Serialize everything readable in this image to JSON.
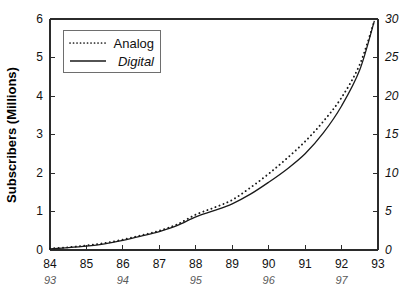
{
  "chart_data": {
    "type": "line",
    "title": "",
    "subtitle": "",
    "xlabel": "",
    "ylabel": "Subscribers (Millions)",
    "ylabel_right": "",
    "grid": false,
    "legend_position": "top-left",
    "xlim": [
      84,
      93
    ],
    "ylim": [
      0,
      6
    ],
    "ylim_right": [
      0,
      30
    ],
    "x_ticks": [
      84,
      85,
      86,
      87,
      88,
      89,
      90,
      91,
      92,
      93
    ],
    "x_tick_labels": [
      "84",
      "85",
      "86",
      "87",
      "88",
      "89",
      "90",
      "91",
      "92",
      "93"
    ],
    "x_ticks_secondary": [
      84,
      86,
      88,
      90,
      92
    ],
    "x_tick_labels_secondary": [
      "93",
      "94",
      "95",
      "96",
      "97"
    ],
    "y_ticks_left": [
      0,
      1,
      2,
      3,
      4,
      5,
      6
    ],
    "y_tick_labels_left": [
      "0",
      "1",
      "2",
      "3",
      "4",
      "5",
      "6"
    ],
    "y_ticks_right": [
      0,
      5,
      10,
      15,
      20,
      25,
      30
    ],
    "y_tick_labels_right": [
      "0",
      "5",
      "10",
      "15",
      "20",
      "25",
      "30"
    ],
    "series": [
      {
        "name": "Analog",
        "style": "dotted",
        "color": "#1a1a1a",
        "x": [
          84.0,
          84.5,
          85.0,
          85.5,
          86.0,
          86.5,
          87.0,
          87.5,
          88.0,
          88.5,
          89.0,
          89.5,
          90.0,
          90.5,
          91.0,
          91.5,
          92.0,
          92.5,
          92.9
        ],
        "values": [
          0.04,
          0.07,
          0.12,
          0.18,
          0.27,
          0.38,
          0.5,
          0.67,
          0.92,
          1.1,
          1.3,
          1.62,
          1.98,
          2.38,
          2.82,
          3.34,
          3.96,
          4.82,
          5.95
        ]
      },
      {
        "name": "Digital",
        "style": "solid",
        "color": "#1a1a1a",
        "x": [
          84.0,
          84.5,
          85.0,
          85.5,
          86.0,
          86.5,
          87.0,
          87.5,
          88.0,
          88.5,
          89.0,
          89.5,
          90.0,
          90.5,
          91.0,
          91.5,
          92.0,
          92.5,
          92.9
        ],
        "values": [
          0.03,
          0.06,
          0.1,
          0.16,
          0.25,
          0.36,
          0.48,
          0.64,
          0.86,
          1.02,
          1.2,
          1.45,
          1.76,
          2.1,
          2.5,
          3.04,
          3.74,
          4.68,
          5.95
        ]
      }
    ],
    "legend": [
      {
        "label": "Analog",
        "style": "dotted",
        "italic": false
      },
      {
        "label": "Digital",
        "style": "solid",
        "italic": true
      }
    ]
  }
}
